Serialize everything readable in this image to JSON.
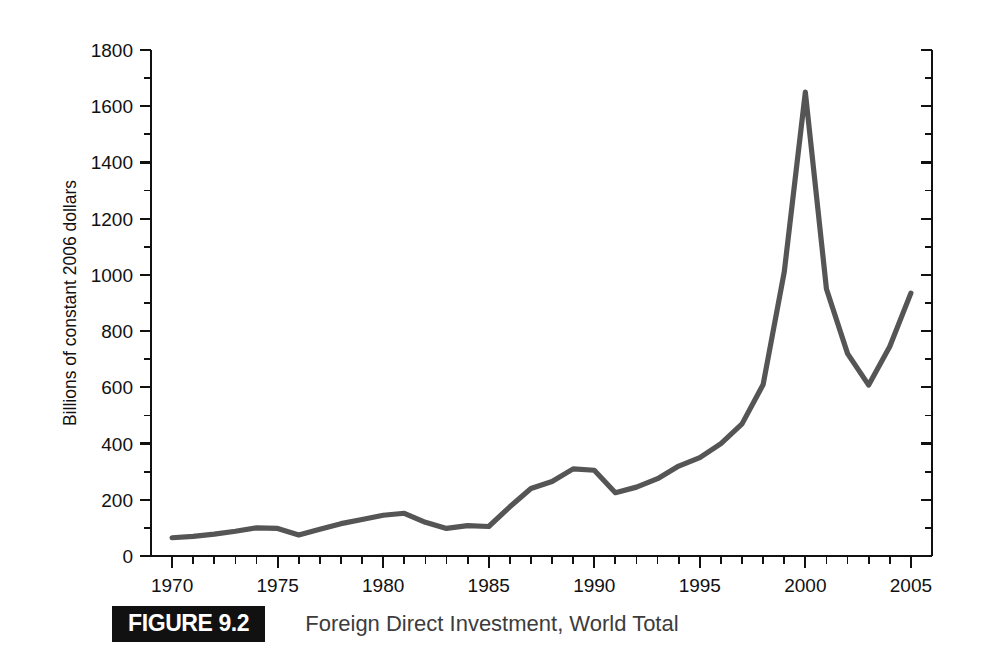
{
  "figure": {
    "badge_label": "FIGURE 9.2",
    "caption": "Foreign Direct Investment, World Total",
    "badge_bg": "#111111",
    "badge_fg": "#ffffff",
    "caption_color": "#3c3c3c"
  },
  "chart_data": {
    "type": "line",
    "title": "Foreign Direct Investment, World Total",
    "xlabel": "",
    "ylabel": "Billions of constant 2006 dollars",
    "xlim": [
      1969,
      2006
    ],
    "ylim": [
      0,
      1800
    ],
    "grid": false,
    "legend": null,
    "line_color": "#555555",
    "axis_color": "#111111",
    "y_major_step": 200,
    "y_minor_step": 100,
    "x_major_step": 5,
    "x_minor_step": 1,
    "ytick_labels": [
      "0",
      "200",
      "400",
      "600",
      "800",
      "1000",
      "1200",
      "1400",
      "1600",
      "1800"
    ],
    "ytick_values": [
      0,
      200,
      400,
      600,
      800,
      1000,
      1200,
      1400,
      1600,
      1800
    ],
    "yminor_values": [
      100,
      300,
      500,
      700,
      900,
      1100,
      1300,
      1500,
      1700
    ],
    "xtick_labels": [
      "1970",
      "1975",
      "1980",
      "1985",
      "1990",
      "1995",
      "2000",
      "2005"
    ],
    "xtick_values": [
      1970,
      1975,
      1980,
      1985,
      1990,
      1995,
      2000,
      2005
    ],
    "x": [
      1970,
      1971,
      1972,
      1973,
      1974,
      1975,
      1976,
      1977,
      1978,
      1979,
      1980,
      1981,
      1982,
      1983,
      1984,
      1985,
      1986,
      1987,
      1988,
      1989,
      1990,
      1991,
      1992,
      1993,
      1994,
      1995,
      1996,
      1997,
      1998,
      1999,
      2000,
      2001,
      2002,
      2003,
      2004,
      2005
    ],
    "values": [
      65,
      70,
      78,
      88,
      100,
      98,
      75,
      95,
      115,
      130,
      145,
      152,
      120,
      98,
      108,
      105,
      175,
      240,
      265,
      310,
      305,
      225,
      245,
      275,
      320,
      350,
      400,
      470,
      610,
      1010,
      1650,
      950,
      720,
      608,
      745,
      935
    ],
    "annotations": []
  }
}
